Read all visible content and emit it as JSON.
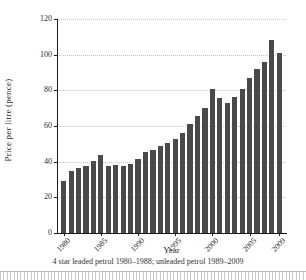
{
  "chart_data": {
    "type": "bar",
    "title": "",
    "xlabel": "Year",
    "ylabel": "Price per litre (pence)",
    "caption": "4 star leaded petrol 1980–1988; unleaded petrol 1989–2009",
    "ylim": [
      0,
      120
    ],
    "y_ticks": [
      0,
      20,
      40,
      60,
      80,
      100,
      120
    ],
    "x_tick_labels": [
      "1980",
      "1985",
      "1990",
      "1995",
      "2000",
      "2005",
      "2009"
    ],
    "grid": "horizontal-dotted",
    "legend": "none",
    "categories": [
      "1980",
      "1981",
      "1982",
      "1983",
      "1984",
      "1985",
      "1986",
      "1987",
      "1988",
      "1989",
      "1990",
      "1991",
      "1992",
      "1993",
      "1994",
      "1995",
      "1996",
      "1997",
      "1998",
      "1999",
      "2000",
      "2001",
      "2002",
      "2003",
      "2004",
      "2005",
      "2006",
      "2007",
      "2008",
      "2009"
    ],
    "values": [
      29,
      35,
      36.5,
      37.5,
      40.5,
      43.5,
      37.5,
      38,
      37.5,
      38.5,
      41.5,
      45.5,
      46.5,
      49,
      50.5,
      53,
      56,
      61,
      65.5,
      70,
      80.5,
      75.5,
      73,
      76.5,
      81,
      87,
      92,
      96,
      108,
      101
    ],
    "colors": {
      "bar": "#4a4a4a",
      "axis": "#1a1a1a",
      "gridline": "#c4c4c4",
      "text": "#2b2b2b",
      "ruler_band": "#c9c9c9"
    }
  }
}
